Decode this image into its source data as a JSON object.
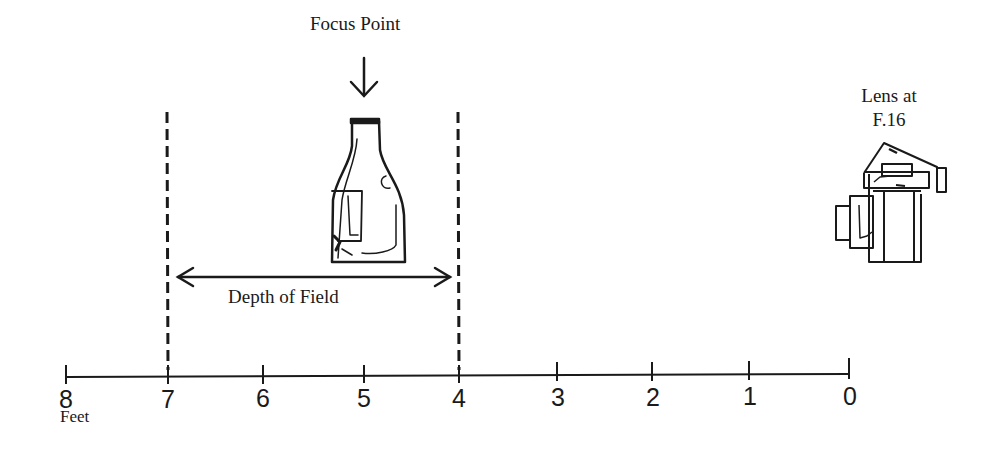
{
  "diagram": {
    "focus_label": "Focus Point",
    "lens_label_line1": "Lens at",
    "lens_label_line2": "F.16",
    "depth_of_field_label": "Depth of Field",
    "unit_label": "Feet",
    "ink_color": "#1a1a1a",
    "background_color": "#ffffff"
  },
  "scale": {
    "ticks": [
      {
        "value": "8",
        "x": 66
      },
      {
        "value": "7",
        "x": 168
      },
      {
        "value": "6",
        "x": 263
      },
      {
        "value": "5",
        "x": 364
      },
      {
        "value": "4",
        "x": 459
      },
      {
        "value": "3",
        "x": 557
      },
      {
        "value": "2",
        "x": 652
      },
      {
        "value": "1",
        "x": 749
      },
      {
        "value": "0",
        "x": 849
      }
    ],
    "depth_of_field_near": "4",
    "depth_of_field_far": "7",
    "focus_distance": "5"
  }
}
